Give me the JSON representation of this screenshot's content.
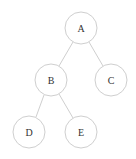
{
  "diagram": {
    "type": "binary-tree",
    "colors": {
      "stroke": "#cfcfcf",
      "text": "#333333",
      "background": "#ffffff"
    },
    "nodes": [
      {
        "id": "A",
        "label": "A",
        "cx": 81,
        "cy": 28,
        "r": 16
      },
      {
        "id": "B",
        "label": "B",
        "cx": 51,
        "cy": 80,
        "r": 16
      },
      {
        "id": "C",
        "label": "C",
        "cx": 111,
        "cy": 80,
        "r": 16
      },
      {
        "id": "D",
        "label": "D",
        "cx": 29,
        "cy": 132,
        "r": 16
      },
      {
        "id": "E",
        "label": "E",
        "cx": 81,
        "cy": 132,
        "r": 16
      }
    ],
    "edges": [
      {
        "from": "A",
        "to": "B"
      },
      {
        "from": "A",
        "to": "C"
      },
      {
        "from": "B",
        "to": "D"
      },
      {
        "from": "B",
        "to": "E"
      }
    ]
  }
}
